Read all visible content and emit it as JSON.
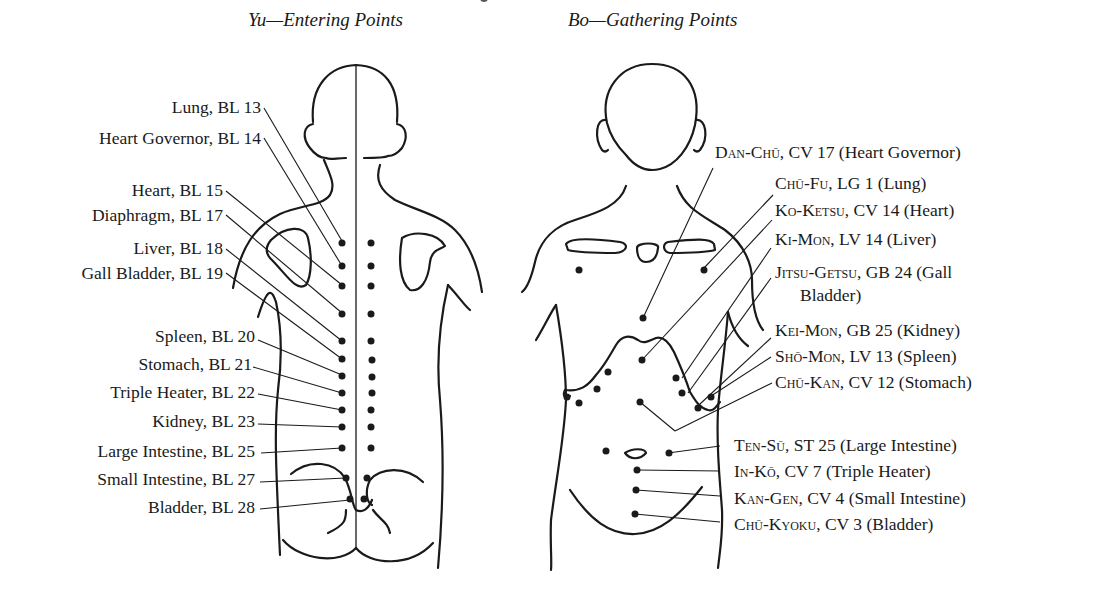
{
  "titles": {
    "back": "Yu—Entering Points",
    "front": "Bo—Gathering Points"
  },
  "yu_points": [
    {
      "organ": "Lung",
      "point": "BL 13",
      "label": "Lung, BL 13"
    },
    {
      "organ": "Heart Governor",
      "point": "BL 14",
      "label": "Heart Governor, BL 14"
    },
    {
      "organ": "Heart",
      "point": "BL 15",
      "label": "Heart, BL 15"
    },
    {
      "organ": "Diaphragm",
      "point": "BL 17",
      "label": "Diaphragm, BL 17"
    },
    {
      "organ": "Liver",
      "point": "BL 18",
      "label": "Liver, BL 18"
    },
    {
      "organ": "Gall Bladder",
      "point": "BL 19",
      "label": "Gall Bladder, BL 19"
    },
    {
      "organ": "Spleen",
      "point": "BL 20",
      "label": "Spleen, BL 20"
    },
    {
      "organ": "Stomach",
      "point": "BL 21",
      "label": "Stomach, BL 21"
    },
    {
      "organ": "Triple Heater",
      "point": "BL 22",
      "label": "Triple Heater, BL 22"
    },
    {
      "organ": "Kidney",
      "point": "BL 23",
      "label": "Kidney, BL 23"
    },
    {
      "organ": "Large Intestine",
      "point": "BL 25",
      "label": "Large Intestine, BL 25"
    },
    {
      "organ": "Small Intestine",
      "point": "BL 27",
      "label": "Small Intestine, BL 27"
    },
    {
      "organ": "Bladder",
      "point": "BL 28",
      "label": "Bladder, BL 28"
    }
  ],
  "bo_points": [
    {
      "name": "Dan-Chū",
      "rest": ", CV 17 (Heart Governor)"
    },
    {
      "name": "Chū-Fu",
      "rest": ", LG 1 (Lung)"
    },
    {
      "name": "Ko-Ketsu",
      "rest": ", CV 14 (Heart)"
    },
    {
      "name": "Ki-Mon",
      "rest": ", LV 14 (Liver)"
    },
    {
      "name": "Jitsu-Getsu",
      "rest": ", GB 24 (Gall",
      "rest2": "Bladder)"
    },
    {
      "name": "Kei-Mon",
      "rest": ", GB 25 (Kidney)"
    },
    {
      "name": "Shō-Mon",
      "rest": ", LV 13 (Spleen)"
    },
    {
      "name": "Chū-Kan",
      "rest": ", CV 12 (Stomach)"
    },
    {
      "name": "Ten-Sū",
      "rest": ", ST 25 (Large Intestine)"
    },
    {
      "name": "In-Kō",
      "rest": ", CV 7 (Triple Heater)"
    },
    {
      "name": "Kan-Gen",
      "rest": ", CV 4 (Small Intestine)"
    },
    {
      "name": "Chū-Kyoku",
      "rest": ", CV 3 (Bladder)"
    }
  ],
  "colors": {
    "ink": "#1a1a1a",
    "background": "#ffffff"
  }
}
